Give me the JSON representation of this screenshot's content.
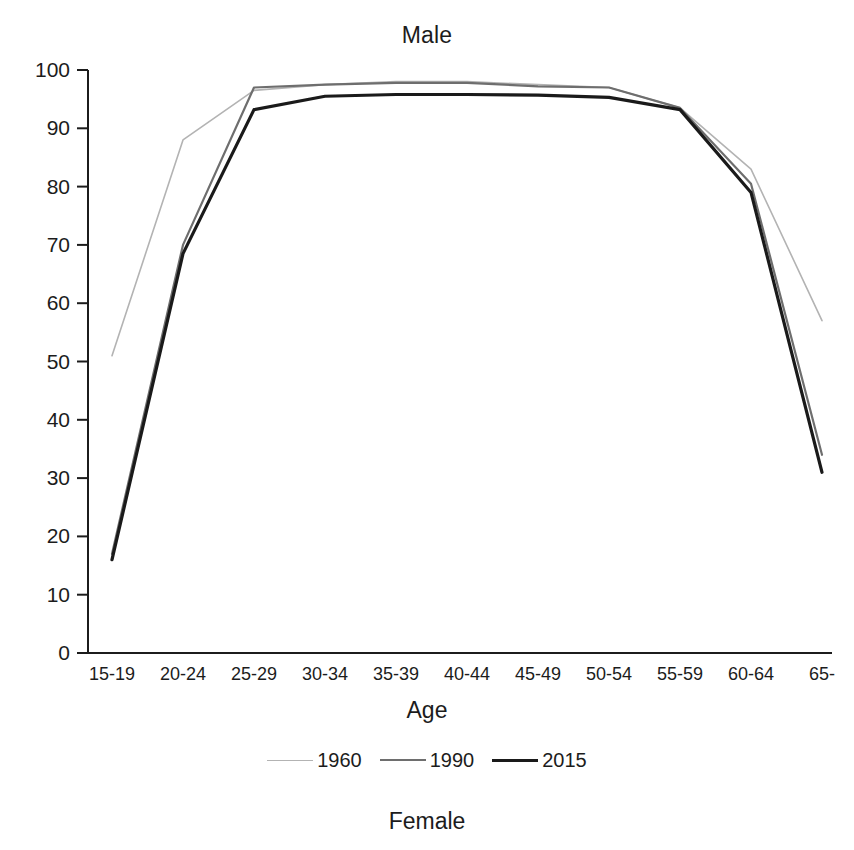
{
  "figure": {
    "title": "Male",
    "caption": "Female"
  },
  "chart_data": {
    "type": "line",
    "title": "Male",
    "xlabel": "Age",
    "ylabel": "",
    "ylim": [
      0,
      100
    ],
    "ytick_step": 10,
    "yticks": [
      "0",
      "10",
      "20",
      "30",
      "40",
      "50",
      "60",
      "70",
      "80",
      "90",
      "100"
    ],
    "grid": false,
    "legend_position": "bottom",
    "categories": [
      "15-19",
      "20-24",
      "25-29",
      "30-34",
      "35-39",
      "40-44",
      "45-49",
      "50-54",
      "55-59",
      "60-64",
      "65-"
    ],
    "series": [
      {
        "name": "1960",
        "color": "#b3b3b3",
        "width": 1.6,
        "values": [
          51,
          88,
          96.5,
          97.5,
          98,
          98,
          97.5,
          97,
          93.5,
          83,
          57
        ]
      },
      {
        "name": "1990",
        "color": "#6e6e6e",
        "width": 2.2,
        "values": [
          17,
          70,
          97,
          97.5,
          97.8,
          97.8,
          97.2,
          97,
          93.5,
          80.5,
          34
        ]
      },
      {
        "name": "2015",
        "color": "#1a1a1a",
        "width": 3.2,
        "values": [
          16,
          68.5,
          93.2,
          95.5,
          95.8,
          95.8,
          95.7,
          95.3,
          93.2,
          79,
          31
        ]
      }
    ]
  },
  "axes": {
    "x_title": "Age"
  },
  "legend": {
    "entries": [
      {
        "label": "1960",
        "color": "#b3b3b3",
        "width": 1.6
      },
      {
        "label": "1990",
        "color": "#6e6e6e",
        "width": 2.2
      },
      {
        "label": "2015",
        "color": "#1a1a1a",
        "width": 3.2
      }
    ]
  }
}
